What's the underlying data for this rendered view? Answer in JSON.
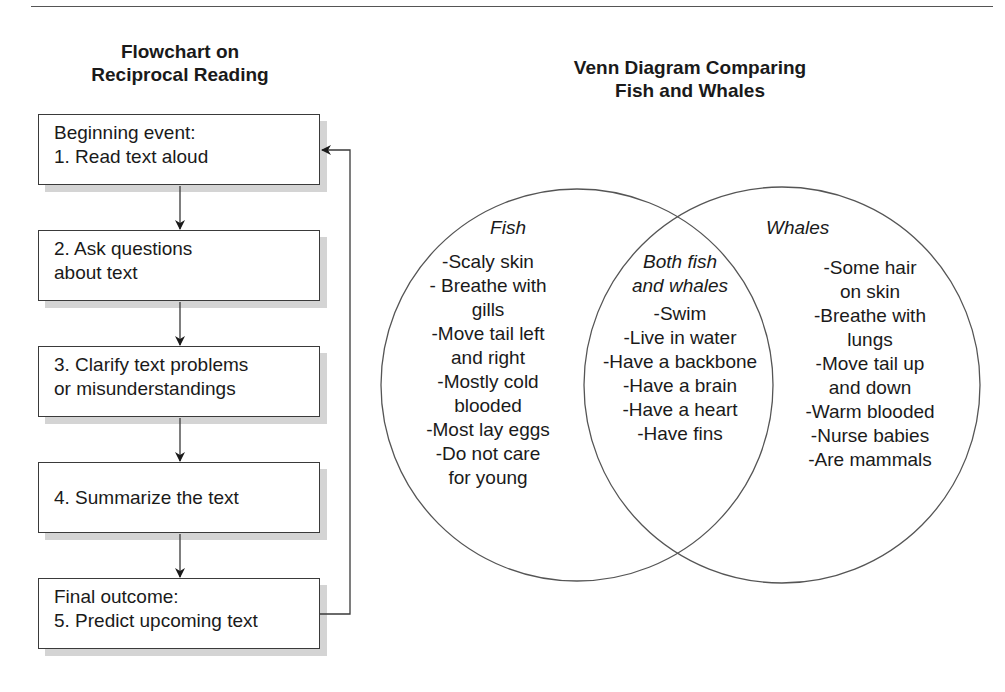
{
  "flowchart": {
    "title_line1": "Flowchart on",
    "title_line2": "Reciprocal Reading",
    "steps": [
      {
        "line1": "Beginning event:",
        "line2": "1. Read text aloud"
      },
      {
        "line1": "2. Ask questions",
        "line2": "about text"
      },
      {
        "line1": "3. Clarify text problems",
        "line2": "or misunderstandings"
      },
      {
        "line1": "4. Summarize the text"
      },
      {
        "line1": "Final outcome:",
        "line2": "5. Predict upcoming text"
      }
    ],
    "feedback_arrow": "from step 5 back to step 1"
  },
  "venn": {
    "title_line1": "Venn Diagram Comparing",
    "title_line2": "Fish and Whales",
    "fish": {
      "label": "Fish",
      "items": [
        "-Scaly skin",
        "- Breathe with",
        "gills",
        "-Move tail left",
        "and right",
        "-Mostly cold",
        "blooded",
        "-Most lay eggs",
        "-Do not care",
        "for young"
      ]
    },
    "both": {
      "label_line1": "Both fish",
      "label_line2": "and whales",
      "items": [
        "-Swim",
        "-Live in water",
        "-Have a backbone",
        "-Have a brain",
        "-Have a heart",
        "-Have fins"
      ]
    },
    "whales": {
      "label": "Whales",
      "items": [
        "-Some hair",
        "on skin",
        "-Breathe with",
        "lungs",
        "-Move tail up",
        "and down",
        "-Warm blooded",
        "-Nurse babies",
        "-Are mammals"
      ]
    }
  },
  "colors": {
    "line": "#3a3a3a",
    "shadow": "#d4d4d4",
    "text": "#1a1a1a"
  }
}
